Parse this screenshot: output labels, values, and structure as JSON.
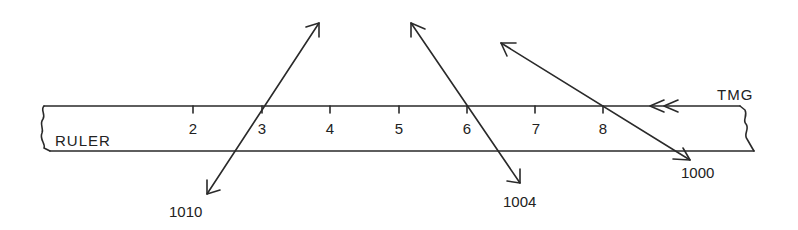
{
  "diagram": {
    "ruler_label": "RULER",
    "tmg_label": "TMG",
    "ticks": [
      {
        "label": "2",
        "x": 193
      },
      {
        "label": "3",
        "x": 262
      },
      {
        "label": "4",
        "x": 330
      },
      {
        "label": "5",
        "x": 399
      },
      {
        "label": "6",
        "x": 467
      },
      {
        "label": "7",
        "x": 535
      },
      {
        "label": "8",
        "x": 603
      }
    ],
    "arrows": [
      {
        "label": "1010",
        "from": [
          206,
          195
        ],
        "to": [
          320,
          22
        ],
        "label_pos": [
          185,
          217
        ],
        "double_headed": true
      },
      {
        "label": "1004",
        "from": [
          520,
          183
        ],
        "to": [
          411,
          22
        ],
        "label_pos": [
          502,
          207
        ],
        "double_headed": true
      },
      {
        "label": "1000",
        "from": [
          690,
          160
        ],
        "to": [
          500,
          42
        ],
        "label_pos": [
          680,
          178
        ],
        "double_headed": true
      }
    ],
    "tmg_direction": "left"
  }
}
